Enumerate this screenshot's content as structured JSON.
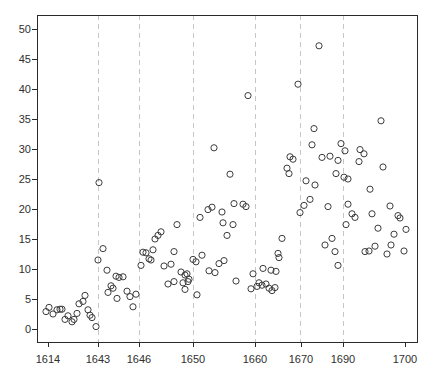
{
  "figure": {
    "width": 428,
    "height": 376,
    "background": "#ffffff"
  },
  "chart_data": {
    "type": "scatter",
    "title": "",
    "xlabel": "",
    "ylabel": "",
    "legend": "none",
    "grid": "vertical dashed lines at selected year labels only",
    "x_axis": {
      "tick_labels": [
        "1614",
        "1643",
        "1646",
        "1650",
        "1660",
        "1670",
        "1690",
        "1700"
      ],
      "tick_px": [
        48,
        98,
        139,
        193,
        255,
        301,
        343,
        405
      ],
      "note": "year labels are irregularly spaced (index-like axis)"
    },
    "y_axis": {
      "tick_labels": [
        "0",
        "5",
        "10",
        "15",
        "20",
        "25",
        "30",
        "35",
        "40",
        "45",
        "50"
      ],
      "tick_values": [
        0,
        5,
        10,
        15,
        20,
        25,
        30,
        35,
        40,
        45,
        50
      ],
      "ylim": [
        -2.2,
        52.3
      ]
    },
    "gridlines": {
      "at_labels": [
        "1643",
        "1646",
        "1650",
        "1660",
        "1670",
        "1690"
      ],
      "at_px": [
        98,
        139,
        193,
        255,
        300,
        343
      ],
      "style": "dashed",
      "color": "#c6c6c6"
    },
    "layout_px": {
      "box_left": 37,
      "box_top": 15,
      "box_right": 417,
      "box_bottom": 342,
      "y_of_zero": 329,
      "px_per_unit": 6,
      "tick_len": 5,
      "x_label_y": 359,
      "y_label_x": 31
    },
    "marker": {
      "shape": "open-circle",
      "radius": 3.1,
      "stroke": "#3d3d3d",
      "fill": "none"
    },
    "axis_color": "#2a2a2a",
    "points_px_value": [
      [
        46,
        2.9
      ],
      [
        49,
        3.6
      ],
      [
        53,
        2.5
      ],
      [
        57,
        3.2
      ],
      [
        60,
        3.3
      ],
      [
        62,
        3.3
      ],
      [
        65,
        1.6
      ],
      [
        68,
        2.2
      ],
      [
        72,
        1.2
      ],
      [
        74,
        1.6
      ],
      [
        77,
        2.6
      ],
      [
        79,
        4.2
      ],
      [
        83,
        4.6
      ],
      [
        85,
        5.6
      ],
      [
        88,
        3.2
      ],
      [
        90,
        2.3
      ],
      [
        92,
        1.9
      ],
      [
        96,
        0.4
      ],
      [
        98,
        11.5
      ],
      [
        99,
        24.4
      ],
      [
        103,
        13.4
      ],
      [
        107,
        9.8
      ],
      [
        108,
        6.1
      ],
      [
        111,
        7.2
      ],
      [
        113,
        6.8
      ],
      [
        116,
        8.8
      ],
      [
        119,
        8.6
      ],
      [
        123,
        8.7
      ],
      [
        117,
        5.1
      ],
      [
        127,
        6.3
      ],
      [
        130,
        5.4
      ],
      [
        133,
        3.7
      ],
      [
        136,
        5.8
      ],
      [
        141,
        10.6
      ],
      [
        143,
        12.8
      ],
      [
        146,
        12.7
      ],
      [
        149,
        11.7
      ],
      [
        151,
        11.5
      ],
      [
        153,
        13.2
      ],
      [
        155,
        15.0
      ],
      [
        158,
        15.6
      ],
      [
        161,
        16.2
      ],
      [
        164,
        10.5
      ],
      [
        168,
        7.5
      ],
      [
        171,
        10.8
      ],
      [
        174,
        7.9
      ],
      [
        174,
        12.9
      ],
      [
        177,
        17.4
      ],
      [
        181,
        9.5
      ],
      [
        183,
        7.7
      ],
      [
        185,
        9.0
      ],
      [
        185,
        6.6
      ],
      [
        187,
        9.2
      ],
      [
        189,
        8.3
      ],
      [
        188,
        7.9
      ],
      [
        193,
        11.6
      ],
      [
        196,
        11.2
      ],
      [
        197,
        5.7
      ],
      [
        200,
        18.6
      ],
      [
        202,
        12.3
      ],
      [
        208,
        19.9
      ],
      [
        209,
        9.7
      ],
      [
        212,
        20.3
      ],
      [
        214,
        30.2
      ],
      [
        215,
        9.4
      ],
      [
        219,
        10.9
      ],
      [
        222,
        19.5
      ],
      [
        223,
        17.7
      ],
      [
        224,
        11.4
      ],
      [
        227,
        15.6
      ],
      [
        230,
        25.8
      ],
      [
        233,
        17.4
      ],
      [
        234,
        20.9
      ],
      [
        243,
        20.8
      ],
      [
        246,
        20.4
      ],
      [
        248,
        38.9
      ],
      [
        236,
        8.0
      ],
      [
        251,
        6.7
      ],
      [
        253,
        9.2
      ],
      [
        257,
        7.1
      ],
      [
        259,
        7.7
      ],
      [
        262,
        7.3
      ],
      [
        266,
        7.5
      ],
      [
        269,
        6.8
      ],
      [
        272,
        6.4
      ],
      [
        275,
        6.9
      ],
      [
        263,
        10.1
      ],
      [
        271,
        9.8
      ],
      [
        276,
        9.6
      ],
      [
        278,
        12.6
      ],
      [
        279,
        11.9
      ],
      [
        282,
        15.1
      ],
      [
        287,
        26.8
      ],
      [
        289,
        25.9
      ],
      [
        290,
        28.7
      ],
      [
        293,
        28.3
      ],
      [
        298,
        40.8
      ],
      [
        300,
        19.4
      ],
      [
        304,
        20.6
      ],
      [
        306,
        24.7
      ],
      [
        310,
        21.6
      ],
      [
        312,
        30.7
      ],
      [
        314,
        33.4
      ],
      [
        315,
        24.0
      ],
      [
        319,
        47.2
      ],
      [
        322,
        28.6
      ],
      [
        325,
        14.0
      ],
      [
        328,
        20.4
      ],
      [
        330,
        28.8
      ],
      [
        332,
        15.1
      ],
      [
        335,
        12.9
      ],
      [
        336,
        25.9
      ],
      [
        338,
        10.6
      ],
      [
        338,
        28.1
      ],
      [
        341,
        30.9
      ],
      [
        344,
        25.3
      ],
      [
        345,
        29.7
      ],
      [
        346,
        17.4
      ],
      [
        348,
        25.0
      ],
      [
        348,
        20.8
      ],
      [
        352,
        19.2
      ],
      [
        355,
        18.6
      ],
      [
        359,
        27.9
      ],
      [
        360,
        29.9
      ],
      [
        364,
        29.2
      ],
      [
        365,
        12.9
      ],
      [
        369,
        13.0
      ],
      [
        370,
        23.3
      ],
      [
        372,
        19.2
      ],
      [
        375,
        13.8
      ],
      [
        378,
        16.8
      ],
      [
        381,
        34.7
      ],
      [
        383,
        27.0
      ],
      [
        387,
        12.5
      ],
      [
        390,
        20.5
      ],
      [
        391,
        14.0
      ],
      [
        394,
        15.8
      ],
      [
        398,
        18.9
      ],
      [
        400,
        18.5
      ],
      [
        404,
        13.0
      ],
      [
        406,
        16.6
      ]
    ]
  }
}
